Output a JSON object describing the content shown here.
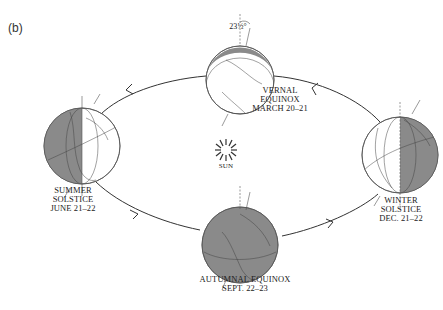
{
  "figure": {
    "panel_label": "(b)"
  },
  "sun": {
    "label": "SUN",
    "icon": "sun-rays-icon"
  },
  "tilt": {
    "label": "23½°"
  },
  "positions": [
    {
      "id": "vernal",
      "lines": [
        "VERNAL",
        "EQUINOX",
        "MARCH 20–21"
      ]
    },
    {
      "id": "summer",
      "lines": [
        "SUMMER",
        "SOLSTICE",
        "JUNE 21–22"
      ]
    },
    {
      "id": "winter",
      "lines": [
        "WINTER",
        "SOLSTICE",
        "DEC. 21–22"
      ]
    },
    {
      "id": "autumn",
      "lines": [
        "AUTUMNAL EQUINOX",
        "SEPT. 22–23"
      ]
    }
  ],
  "colors": {
    "night_shade": "#8a8a8a",
    "line": "#333333",
    "globe_outline": "#555555",
    "background": "#ffffff"
  }
}
